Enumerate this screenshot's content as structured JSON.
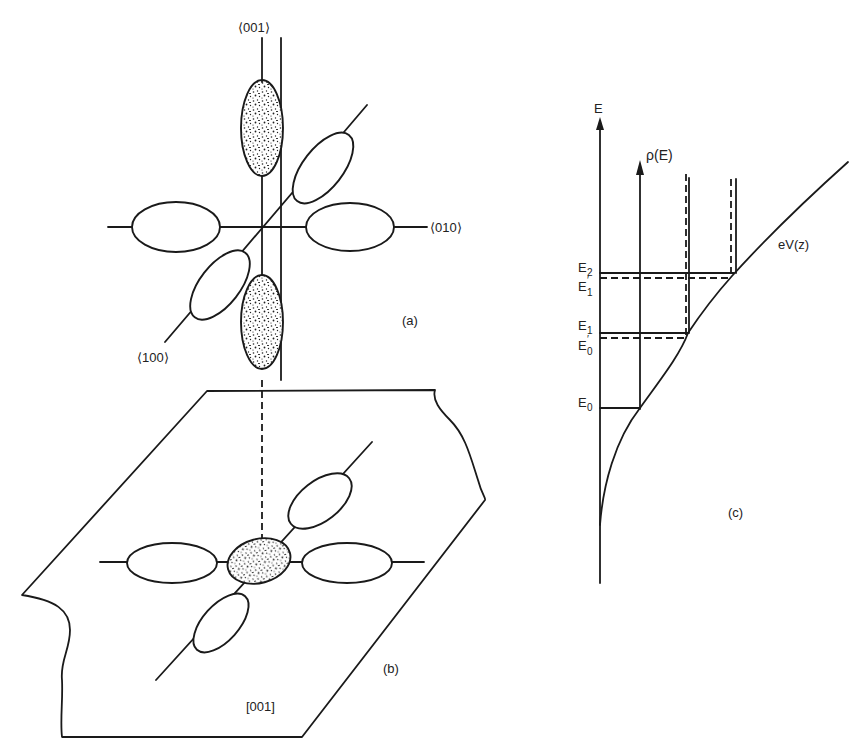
{
  "panel_a": {
    "label": "(a)",
    "axis_001": "⟨001⟩",
    "axis_010": "⟨010⟩",
    "axis_100": "⟨100⟩"
  },
  "panel_b": {
    "label": "(b)",
    "plane_label": "[001]"
  },
  "panel_c": {
    "label": "(c)",
    "energy_axis": "E",
    "dos_label": "ρ(E)",
    "potential_label": "eV(z)",
    "levels": {
      "E2": {
        "base": "E",
        "sub": "2"
      },
      "E1p": {
        "base": "E",
        "sub": "1",
        "prime": "′"
      },
      "E1": {
        "base": "E",
        "sub": "1"
      },
      "E0p": {
        "base": "E",
        "sub": "0",
        "prime": "′"
      },
      "E0": {
        "base": "E",
        "sub": "0"
      }
    }
  },
  "colors": {
    "ink": "#1a1a1a",
    "paper": "#ffffff"
  }
}
